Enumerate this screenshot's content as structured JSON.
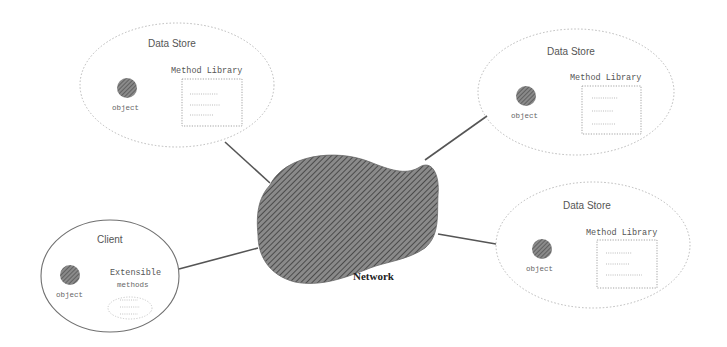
{
  "diagram": {
    "network": {
      "label": "Network",
      "fill": "#6e6e6e"
    },
    "nodes": [
      {
        "id": "ds-top-left",
        "title": "Data Store",
        "object_label": "object",
        "library_label": "Method Library"
      },
      {
        "id": "ds-top-right",
        "title": "Data Store",
        "object_label": "object",
        "library_label": "Method Library"
      },
      {
        "id": "ds-bottom-right",
        "title": "Data Store",
        "object_label": "object",
        "library_label": "Method Library"
      },
      {
        "id": "client",
        "title": "Client",
        "object_label": "object",
        "library_label": "Extensible",
        "library_label2": "methods"
      }
    ],
    "colors": {
      "ellipse_stroke": "#b8b8b8",
      "client_stroke": "#707070",
      "connector": "#555555",
      "object_fill": "#6a6a6a"
    }
  }
}
